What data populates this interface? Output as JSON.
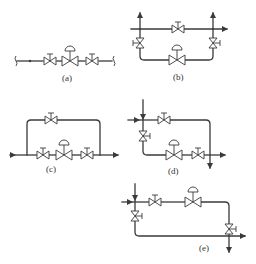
{
  "diagram": {
    "type": "piping-schematic",
    "colors": {
      "line": "#3a3a3a",
      "background": "#ffffff",
      "label": "#333333"
    },
    "panels": [
      {
        "id": "a",
        "label": "(a)",
        "components": [
          "break-symbol",
          "manual-valve",
          "control-valve",
          "manual-valve",
          "break-symbol"
        ]
      },
      {
        "id": "b",
        "label": "(b)",
        "components": [
          "manual-valve",
          "manual-valve",
          "control-valve",
          "manual-valve",
          "flow-arrow-up",
          "flow-arrow-up",
          "flow-arrow-right"
        ]
      },
      {
        "id": "c",
        "label": "(c)",
        "components": [
          "bypass-manual-valve",
          "manual-valve",
          "control-valve",
          "manual-valve",
          "flow-arrow-in",
          "flow-arrow-out"
        ]
      },
      {
        "id": "d",
        "label": "(d)",
        "components": [
          "manual-valve",
          "manual-valve",
          "control-valve",
          "manual-valve",
          "flow-arrow-right",
          "flow-arrow-down"
        ]
      },
      {
        "id": "e",
        "label": "(e)",
        "components": [
          "manual-valve",
          "control-valve",
          "manual-valve",
          "manual-valve",
          "flow-arrow-right",
          "flow-arrow-down"
        ]
      }
    ]
  }
}
